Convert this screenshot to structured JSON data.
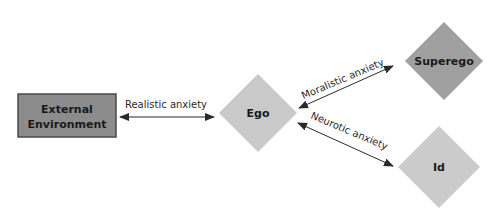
{
  "diagram": {
    "type": "psychoanalytic anxiety diagram",
    "nodes": [
      {
        "id": "external",
        "label_line1": "External",
        "label_line2": "Environment",
        "shape": "rectangle",
        "fill": "#8c8c8c"
      },
      {
        "id": "ego",
        "label": "Ego",
        "shape": "diamond",
        "fill": "#c9c9c9"
      },
      {
        "id": "superego",
        "label": "Superego",
        "shape": "diamond",
        "fill": "#a0a0a0"
      },
      {
        "id": "id",
        "label": "Id",
        "shape": "diamond",
        "fill": "#cbcbcb"
      }
    ],
    "edges": [
      {
        "from": "external",
        "to": "ego",
        "label": "Realistic anxiety",
        "bidirectional": true
      },
      {
        "from": "ego",
        "to": "superego",
        "label": "Moralistic anxiety",
        "bidirectional": true
      },
      {
        "from": "ego",
        "to": "id",
        "label": "Neurotic anxiety",
        "bidirectional": true
      }
    ]
  },
  "labels": {
    "external_line1": "External",
    "external_line2": "Environment",
    "ego": "Ego",
    "superego": "Superego",
    "id": "Id",
    "realistic": "Realistic anxiety",
    "moralistic": "Moralistic anxiety",
    "neurotic": "Neurotic anxiety"
  },
  "colors": {
    "external_fill": "#8c8c8c",
    "external_border": "#4a4a4a",
    "ego_fill": "#c9c9c9",
    "superego_fill": "#a0a0a0",
    "id_fill": "#cbcbcb",
    "arrow": "#2a2a2a"
  }
}
